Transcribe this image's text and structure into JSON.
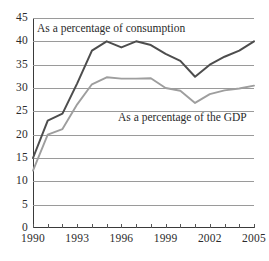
{
  "chart_data": {
    "type": "line",
    "title": "",
    "xlabel": "",
    "ylabel": "",
    "xlim": [
      1990,
      2005
    ],
    "ylim": [
      0,
      45
    ],
    "grid": true,
    "legend_position": "inline-annotations",
    "x": [
      1990,
      1991,
      1992,
      1993,
      1994,
      1995,
      1996,
      1997,
      1998,
      1999,
      2000,
      2001,
      2002,
      2003,
      2004,
      2005
    ],
    "x_tick_labels": [
      "1990",
      "1993",
      "1996",
      "1999",
      "2002",
      "2005"
    ],
    "x_tick_values": [
      1990,
      1993,
      1996,
      1999,
      2002,
      2005
    ],
    "y_tick_labels": [
      "0",
      "5",
      "10",
      "15",
      "20",
      "25",
      "30",
      "35",
      "40",
      "45"
    ],
    "y_tick_values": [
      0,
      5,
      10,
      15,
      20,
      25,
      30,
      35,
      40,
      45
    ],
    "series": [
      {
        "name": "As a percentage of consumption",
        "color": "#4d4d4d",
        "values": [
          15.0,
          23.0,
          24.5,
          31.0,
          38.0,
          40.0,
          38.7,
          40.0,
          39.2,
          37.3,
          35.8,
          32.4,
          35.0,
          36.7,
          38.0,
          40.0
        ]
      },
      {
        "name": "As a percentage of the GDP",
        "color": "#9e9e9e",
        "values": [
          12.3,
          20.0,
          21.2,
          26.5,
          30.8,
          32.3,
          32.0,
          32.0,
          32.1,
          30.0,
          29.4,
          26.8,
          28.7,
          29.5,
          29.9,
          30.5
        ]
      }
    ],
    "annotations": [
      {
        "text": "As a percentage of consumption",
        "series": 0
      },
      {
        "text": "As a percentage of the GDP",
        "series": 1
      }
    ]
  }
}
